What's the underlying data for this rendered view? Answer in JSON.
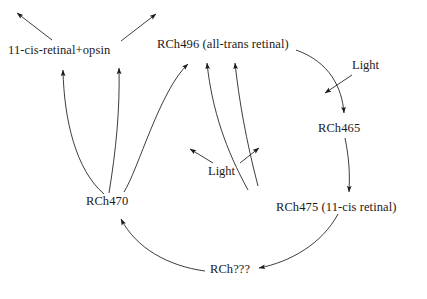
{
  "diagram": {
    "background_color": "#ffffff",
    "stroke_color": "#1a1a1a",
    "nodes": [
      {
        "id": "opsin",
        "label": "11-cis-retinal+opsin"
      },
      {
        "id": "rch496",
        "label": "RCh496 (all-trans retinal)"
      },
      {
        "id": "rch465",
        "label": "RCh465"
      },
      {
        "id": "rch475",
        "label": "RCh475 (11-cis retinal)"
      },
      {
        "id": "rch470",
        "label": "RCh470"
      },
      {
        "id": "rchunk",
        "label": "RCh???"
      }
    ],
    "annotations": [
      {
        "id": "light-right",
        "label": "Light"
      },
      {
        "id": "light-center",
        "label": "Light"
      }
    ],
    "edges": [
      {
        "from": "opsin",
        "to": "outside-upper-left",
        "style": "straight"
      },
      {
        "from": "opsin",
        "to": "outside-upper-right",
        "style": "straight"
      },
      {
        "from": "rch470",
        "to": "opsin",
        "style": "curved"
      },
      {
        "from": "rch470",
        "to": "rch496",
        "style": "curved"
      },
      {
        "from": "rch470",
        "to": "rch496",
        "style": "curved-outer"
      },
      {
        "from": "rch475",
        "to": "rch496",
        "style": "curved"
      },
      {
        "from": "rch496",
        "to": "rch465",
        "style": "curved"
      },
      {
        "from": "rch465",
        "to": "rch475",
        "style": "curved"
      },
      {
        "from": "rch475",
        "to": "rchunk",
        "style": "curved"
      },
      {
        "from": "rchunk",
        "to": "rch470",
        "style": "curved"
      },
      {
        "from": "light-right",
        "to": "rch496-rch465-edge",
        "style": "straight"
      },
      {
        "from": "light-center",
        "to": "rch470-rch496-edge",
        "style": "straight"
      },
      {
        "from": "light-center",
        "to": "rch475-rch496-edge",
        "style": "straight"
      }
    ]
  }
}
